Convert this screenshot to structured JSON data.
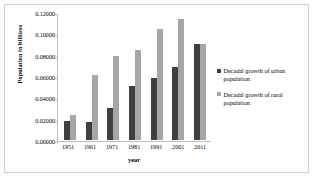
{
  "chart_data": {
    "type": "bar",
    "title": "",
    "xlabel": "year",
    "ylabel": "Population in billions",
    "categories": [
      "1951",
      "1961",
      "1971",
      "1981",
      "1991",
      "2001",
      "2011"
    ],
    "series": [
      {
        "name": "Decadal growth of urban population",
        "color": "#3f3f3f",
        "values": [
          0.018,
          0.017,
          0.03,
          0.051,
          0.059,
          0.069,
          0.091
        ]
      },
      {
        "name": "Decadal growth of rural population",
        "color": "#a6a6a6",
        "values": [
          0.024,
          0.061,
          0.079,
          0.085,
          0.105,
          0.114,
          0.091
        ]
      }
    ],
    "ylim": [
      0.0,
      0.12
    ],
    "yticks": [
      0.0,
      0.02,
      0.04,
      0.06,
      0.08,
      0.1,
      0.12
    ],
    "ytick_labels": [
      "0.00000",
      "0.02000",
      "0.04000",
      "0.06000",
      "0.08000",
      "0.10000",
      "0.12000"
    ],
    "grid": false,
    "legend_position": "right"
  },
  "legend": {
    "entries": [
      {
        "label": "Decadal growth of urban population",
        "color": "#3f3f3f"
      },
      {
        "label": "Decadal growth of rural population",
        "color": "#a6a6a6"
      }
    ]
  },
  "colors": {
    "urban": "#3f3f3f",
    "rural": "#a6a6a6",
    "axis": "#bdbdbd",
    "frame": "#d0d0d0",
    "background": "#ffffff"
  }
}
